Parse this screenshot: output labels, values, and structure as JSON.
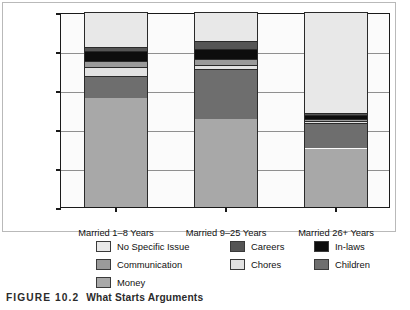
{
  "caption": {
    "figure_number": "FIGURE 10.2",
    "title": "What Starts Arguments"
  },
  "chart_data": {
    "type": "bar",
    "subtype": "stacked-bar-100",
    "title": "What Starts Arguments",
    "xlabel": "",
    "ylabel": "PERCENTAGE OF ARGUMENTS",
    "ylim": [
      0,
      100
    ],
    "yticks": [
      0,
      20,
      40,
      60,
      80,
      100
    ],
    "ytick_labels": [
      "0",
      "20",
      "40",
      "60",
      "80",
      "100"
    ],
    "grid": true,
    "legend_position": "below",
    "categories": [
      "Married 1–8 Years",
      "Married 9–25 Years",
      "Married 26+ Years"
    ],
    "series": [
      {
        "name": "Money",
        "color": "#a8a8a8",
        "values": [
          56,
          45,
          30
        ]
      },
      {
        "name": "Children",
        "color": "#6e6e6e",
        "values": [
          11,
          26,
          13
        ]
      },
      {
        "name": "Chores",
        "color": "#e2e2e2",
        "values": [
          5,
          2,
          1
        ]
      },
      {
        "name": "Communication",
        "color": "#9a9a9a",
        "values": [
          3,
          3,
          1
        ]
      },
      {
        "name": "In-laws",
        "color": "#0d0d0d",
        "values": [
          5,
          5,
          2
        ]
      },
      {
        "name": "Careers",
        "color": "#555555",
        "values": [
          2,
          4,
          1
        ]
      },
      {
        "name": "No Specific Issue",
        "color": "#e8e8e8",
        "values": [
          18,
          15,
          52
        ]
      }
    ]
  },
  "legend": {
    "columns": [
      [
        {
          "label": "No Specific Issue",
          "color": "#e8e8e8"
        },
        {
          "label": "Communication",
          "color": "#9a9a9a"
        },
        {
          "label": "Money",
          "color": "#a8a8a8"
        }
      ],
      [
        {
          "label": "Careers",
          "color": "#555555"
        },
        {
          "label": "Chores",
          "color": "#e2e2e2"
        }
      ],
      [
        {
          "label": "In-laws",
          "color": "#0d0d0d"
        },
        {
          "label": "Children",
          "color": "#6e6e6e"
        }
      ]
    ]
  }
}
